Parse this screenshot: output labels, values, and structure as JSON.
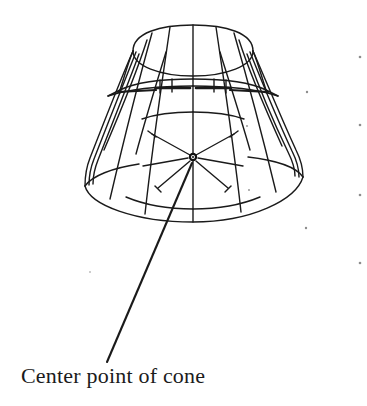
{
  "figure": {
    "background_color": "#ffffff",
    "line_color": "#1a1a1a",
    "text_color": "#1b1b1b",
    "caption": "Center point of cone"
  },
  "annotation": {
    "label": "Center point of cone",
    "leader_line": {
      "from_x": 192,
      "from_y": 163,
      "to_x": 107,
      "to_y": 362
    },
    "center_point": {
      "x": 193,
      "y": 157,
      "marker": "node-dot"
    }
  },
  "cone_geometry": {
    "apex_rim_center_x": 193,
    "top_rim_top_y": 25,
    "top_rim_rx": 60,
    "top_rim_ry": 26,
    "bottom_rim_center_y": 196,
    "bottom_rim_rx": 109,
    "bottom_rim_ry": 26,
    "axis_top_y": 25,
    "axis_bottom_y": 222,
    "meridian_count": 12,
    "band_rows": 3,
    "center_spoke_count": 6
  },
  "speckles": [
    {
      "x": 360,
      "y": 57
    },
    {
      "x": 307,
      "y": 92
    },
    {
      "x": 360,
      "y": 125
    },
    {
      "x": 360,
      "y": 195
    },
    {
      "x": 306,
      "y": 228
    },
    {
      "x": 360,
      "y": 263
    }
  ]
}
